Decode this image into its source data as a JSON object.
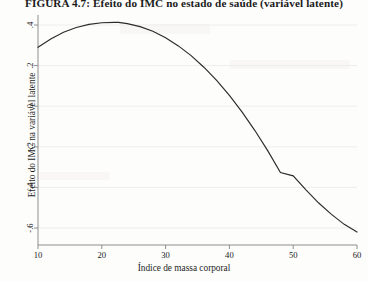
{
  "figure": {
    "title": "FIGURA 4.7: Efeito do IMC no estado de saúde (variável latente)"
  },
  "chart_data": {
    "type": "line",
    "title": "FIGURA 4.7: Efeito do IMC no estado de saúde (variável latente)",
    "xlabel": "Índice de massa corporal",
    "ylabel": "Efeito do IMC na variável latente",
    "xlim": [
      10,
      60
    ],
    "ylim": [
      -0.62,
      0.42
    ],
    "xticks": [
      10,
      20,
      30,
      40,
      50,
      60
    ],
    "xtick_labels": [
      "10",
      "20",
      "30",
      "40",
      "50",
      "60"
    ],
    "yticks": [
      0.4,
      0.2,
      0,
      -0.2,
      -0.4,
      -0.6
    ],
    "ytick_labels": [
      ".4",
      ".2",
      "0",
      "-.2",
      "-.4",
      "-.6"
    ],
    "grid": "horizontal",
    "legend": "none",
    "series": [
      {
        "name": "Efeito do IMC na variável latente",
        "color": "#2b2b2b",
        "x": [
          10,
          12,
          14,
          16,
          18,
          20,
          22,
          22.6,
          24,
          26,
          28,
          30,
          32,
          34,
          36,
          38,
          40,
          42,
          44,
          46,
          48,
          50,
          52,
          54,
          56,
          58,
          60
        ],
        "y": [
          0.29,
          0.331,
          0.364,
          0.388,
          0.403,
          0.411,
          0.413,
          0.413,
          0.407,
          0.392,
          0.369,
          0.337,
          0.297,
          0.249,
          0.192,
          0.127,
          0.053,
          -0.029,
          -0.12,
          -0.219,
          -0.327,
          -0.343,
          -0.412,
          -0.477,
          -0.533,
          -0.582,
          -0.62
        ]
      }
    ]
  }
}
